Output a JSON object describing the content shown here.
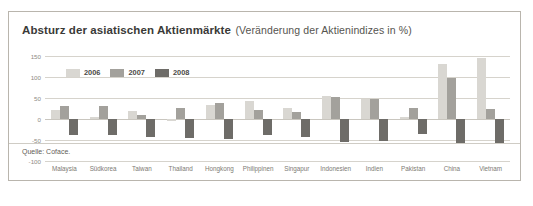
{
  "figure": {
    "title_main": "Absturz der asiatischen Aktienmärkte",
    "title_sub": "(Veränderung der Aktienindizes in %)",
    "source": "Quelle: Coface."
  },
  "colors": {
    "series_2006": "#d9d7d2",
    "series_2007": "#a3a19c",
    "series_2008": "#6e6c68",
    "grid": "#d6d3cc",
    "axis_text": "#8d8a84",
    "title": "#3a3a38",
    "border": "#b9b5ad"
  },
  "chart_data": {
    "type": "bar",
    "title": "Absturz der asiatischen Aktienmärkte (Veränderung der Aktienindizes in %)",
    "xlabel": "",
    "ylabel": "%",
    "ylim": [
      -100,
      150
    ],
    "yticks": [
      150,
      100,
      50,
      0,
      -50,
      -100
    ],
    "grid": true,
    "legend_position": "top-left",
    "categories": [
      "Malaysia",
      "Südkorea",
      "Taiwan",
      "Thailand",
      "Hongkong",
      "Philippinen",
      "Singapur",
      "Indonesien",
      "Indien",
      "Pakistan",
      "China",
      "Vietnam"
    ],
    "series": [
      {
        "name": "2006",
        "color": "#d9d7d2",
        "values": [
          22,
          4,
          19,
          -5,
          34,
          42,
          27,
          55,
          47,
          5,
          130,
          145
        ]
      },
      {
        "name": "2007",
        "color": "#a3a19c",
        "values": [
          32,
          32,
          9,
          26,
          39,
          21,
          17,
          52,
          47,
          27,
          97,
          25
        ]
      },
      {
        "name": "2008",
        "color": "#6e6c68",
        "values": [
          -39,
          -38,
          -43,
          -46,
          -48,
          -37,
          -44,
          -54,
          -52,
          -36,
          -60,
          -58
        ]
      }
    ]
  },
  "legend": [
    {
      "label": "2006",
      "color": "#d9d7d2"
    },
    {
      "label": "2007",
      "color": "#a3a19c"
    },
    {
      "label": "2008",
      "color": "#6e6c68"
    }
  ]
}
